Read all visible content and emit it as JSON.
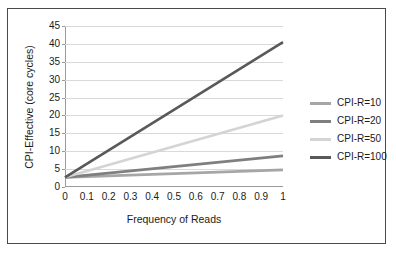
{
  "chart_data": {
    "type": "line",
    "title": "",
    "xlabel": "Frequency of Reads",
    "ylabel": "CPI-Effective (core cycles)",
    "xlim": [
      0,
      1
    ],
    "ylim": [
      0,
      45
    ],
    "grid": "horizontal",
    "legend_position": "right",
    "x": [
      0,
      1
    ],
    "xticks": [
      "0",
      "0.1",
      "0.2",
      "0.3",
      "0.4",
      "0.5",
      "0.6",
      "0.7",
      "0.8",
      "0.9",
      "1"
    ],
    "yticks": [
      "0",
      "5",
      "10",
      "15",
      "20",
      "25",
      "30",
      "35",
      "40",
      "45"
    ],
    "series": [
      {
        "name": "CPI-R=10",
        "values": [
          2.7,
          4.8
        ],
        "color": "#a6a6a6"
      },
      {
        "name": "CPI-R=20",
        "values": [
          2.7,
          8.7
        ],
        "color": "#7f7f7f"
      },
      {
        "name": "CPI-R=50",
        "values": [
          2.7,
          20.0
        ],
        "color": "#d4d4d4"
      },
      {
        "name": "CPI-R=100",
        "values": [
          2.7,
          40.5
        ],
        "color": "#595959"
      }
    ]
  },
  "legend": {
    "items": [
      {
        "label": "CPI-R=10"
      },
      {
        "label": "CPI-R=20"
      },
      {
        "label": "CPI-R=50"
      },
      {
        "label": "CPI-R=100"
      }
    ]
  }
}
